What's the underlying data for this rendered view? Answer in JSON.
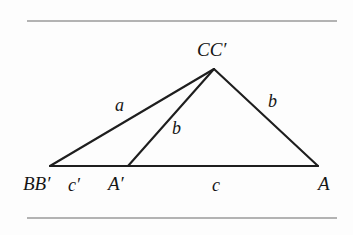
{
  "figure": {
    "kind": "geometry-diagram",
    "background_color": "#fdfdfd",
    "ink_color": "#1e1e1e",
    "rule_color": "#9a9a9a",
    "page_rules": [
      {
        "name": "top-rule",
        "x1": 27,
        "y1": 21,
        "x2": 337,
        "y2": 21
      },
      {
        "name": "bottom-rule",
        "x1": 27,
        "y1": 218,
        "x2": 337,
        "y2": 218
      }
    ],
    "points": [
      {
        "id": "BB",
        "label": "BB′",
        "x": 50,
        "y": 166
      },
      {
        "id": "Aprime",
        "label": "A′",
        "x": 128,
        "y": 166
      },
      {
        "id": "A",
        "label": "A",
        "x": 318,
        "y": 166
      },
      {
        "id": "CC",
        "label": "CC′",
        "x": 214,
        "y": 69
      }
    ],
    "segments": [
      {
        "id": "seg-BB-CC",
        "from": "BB",
        "to": "CC",
        "label": "a"
      },
      {
        "id": "seg-Aprime-CC",
        "from": "Aprime",
        "to": "CC",
        "label": "b"
      },
      {
        "id": "seg-CC-A",
        "from": "CC",
        "to": "A",
        "label": "b"
      },
      {
        "id": "seg-BB-A",
        "from": "BB",
        "to": "A",
        "label": ""
      }
    ],
    "base_segments": [
      {
        "id": "seg-BB-Aprime",
        "from": "BB",
        "to": "Aprime",
        "label": "c′"
      },
      {
        "id": "seg-Aprime-A",
        "from": "Aprime",
        "to": "A",
        "label": "c"
      }
    ],
    "labels": {
      "apex": "CC′",
      "left_vertex": "BB′",
      "mid_vertex": "A′",
      "right_vertex": "A",
      "side_a": "a",
      "side_b_cevian": "b",
      "side_b_right": "b",
      "base_cprime": "c′",
      "base_c": "c"
    }
  }
}
